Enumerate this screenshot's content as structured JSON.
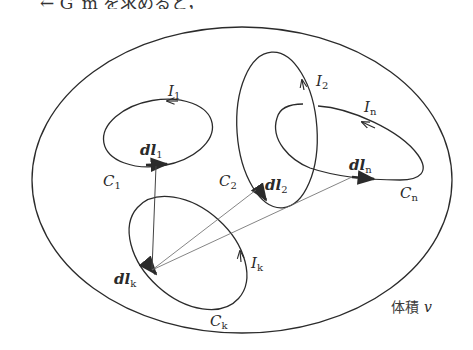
{
  "header_fragment": "← G_m を求めると，",
  "diagram": {
    "volume_label": "体積",
    "volume_var": "v",
    "circuits": [
      {
        "id": "C1",
        "curve_label": "C",
        "curve_sub": "1",
        "current_label": "I",
        "current_sub": "1",
        "element_label": "dl",
        "element_sub": "1"
      },
      {
        "id": "C2",
        "curve_label": "C",
        "curve_sub": "2",
        "current_label": "I",
        "current_sub": "2",
        "element_label": "dl",
        "element_sub": "2"
      },
      {
        "id": "Cn",
        "curve_label": "C",
        "curve_sub": "n",
        "current_label": "I",
        "current_sub": "n",
        "element_label": "dl",
        "element_sub": "n"
      },
      {
        "id": "Ck",
        "curve_label": "C",
        "curve_sub": "k",
        "current_label": "I",
        "current_sub": "k",
        "element_label": "dl",
        "element_sub": "k"
      }
    ],
    "colors": {
      "stroke": "#2b2b2b",
      "thin_line": "#555555",
      "background": "#ffffff"
    }
  }
}
